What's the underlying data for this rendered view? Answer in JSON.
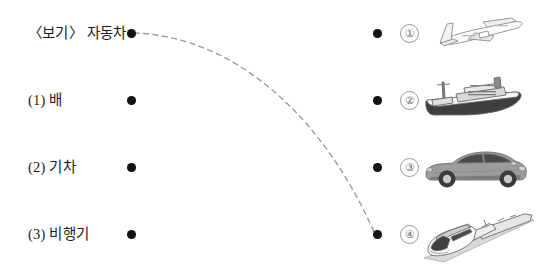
{
  "worksheet": {
    "type": "matching-exercise",
    "language": "ko",
    "left_column": [
      {
        "label": "〈보기〉 자동차",
        "dot": "left-dot-example",
        "y": 33
      },
      {
        "label": "(1) 배",
        "dot": "left-dot-1",
        "y": 100
      },
      {
        "label": "(2) 기차",
        "dot": "left-dot-2",
        "y": 167
      },
      {
        "label": "(3) 비행기",
        "dot": "left-dot-3",
        "y": 234
      }
    ],
    "right_column": [
      {
        "number": "①",
        "picture": "airplane",
        "y": 33
      },
      {
        "number": "②",
        "picture": "ship",
        "y": 100
      },
      {
        "number": "③",
        "picture": "car",
        "y": 167
      },
      {
        "number": "④",
        "picture": "train",
        "y": 234
      }
    ],
    "connection": {
      "from": "left-dot-example",
      "to": "right-dot-3",
      "style": "dashed-curve",
      "color": "#9b9b9b",
      "from_point": [
        131,
        33
      ],
      "to_point": [
        377,
        234
      ]
    }
  },
  "colors": {
    "background": "#ffffff",
    "text": "#1c1c1c",
    "dot": "#141414",
    "circle_outline": "#9a9a9a",
    "circle_text": "#6e6e6e",
    "connector": "#9b9b9b"
  }
}
